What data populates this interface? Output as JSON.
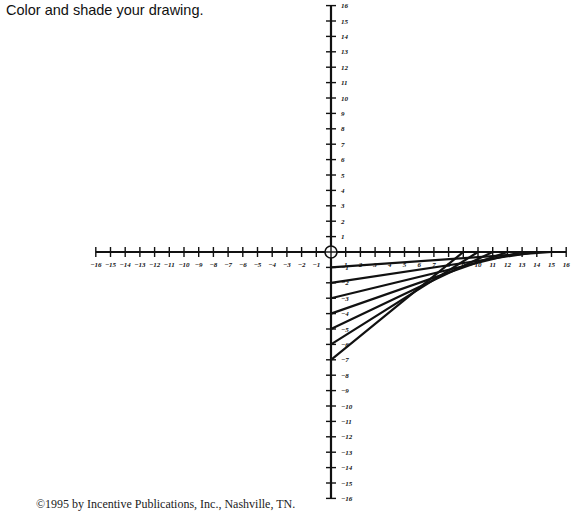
{
  "instruction": "Color and shade your drawing.",
  "credit": "©1995 by Incentive Publications, Inc., Nashville, TN.",
  "graph": {
    "origin_px": [
      331,
      252
    ],
    "unit_x_px": 14.7,
    "unit_y_px": 15.4,
    "x_range": [
      -16,
      16
    ],
    "y_range": [
      -16,
      16
    ],
    "line_color": "#111111"
  },
  "chart_data": {
    "type": "line",
    "title": "",
    "xlabel": "",
    "ylabel": "",
    "xlim": [
      -16,
      16
    ],
    "ylim": [
      -16,
      16
    ],
    "grid": false,
    "segments": [
      {
        "from": [
          0,
          -1
        ],
        "to": [
          15,
          0
        ]
      },
      {
        "from": [
          0,
          -2
        ],
        "to": [
          14,
          0
        ]
      },
      {
        "from": [
          0,
          -3
        ],
        "to": [
          13,
          0
        ]
      },
      {
        "from": [
          0,
          -4
        ],
        "to": [
          12,
          0
        ]
      },
      {
        "from": [
          0,
          -5
        ],
        "to": [
          11,
          0
        ]
      },
      {
        "from": [
          0,
          -6
        ],
        "to": [
          10,
          0
        ]
      },
      {
        "from": [
          0,
          -7
        ],
        "to": [
          9,
          0
        ]
      }
    ]
  }
}
